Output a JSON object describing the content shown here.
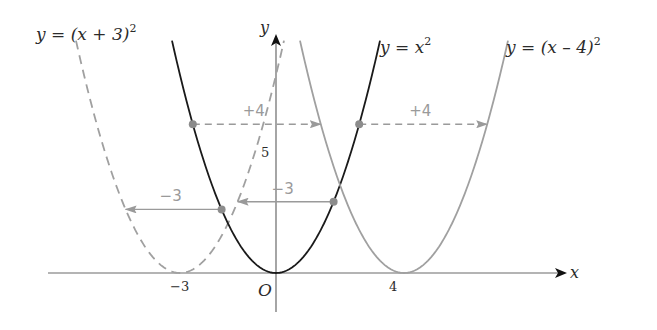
{
  "chart_data": {
    "type": "line",
    "title": "",
    "xlabel": "x",
    "ylabel": "y",
    "origin_label": "O",
    "x_ticks": [
      {
        "value": -3,
        "label": "−3"
      },
      {
        "value": 4,
        "label": "4"
      }
    ],
    "y_ticks": [
      {
        "value": 5,
        "label": "5"
      }
    ],
    "grid": false,
    "xlim": [
      -7,
      9
    ],
    "ylim": [
      0,
      10.5
    ],
    "series": [
      {
        "name": "y = (x + 3)^2",
        "label_main": "y = (x + 3)",
        "label_sup": "2",
        "h": -3,
        "style": "dashed",
        "color": "#a0a0a0"
      },
      {
        "name": "y = x^2",
        "label_main": "y = x",
        "label_sup": "2",
        "h": 0,
        "style": "solid",
        "color": "#1a1a1a"
      },
      {
        "name": "y = (x − 4)^2",
        "label_main": "y = (x – 4)",
        "label_sup": "2",
        "h": 4,
        "style": "solid",
        "color": "#a0a0a0"
      }
    ],
    "annotations": [
      {
        "label": "+4",
        "from_x": -2.6,
        "shift": 4,
        "line": "dashed"
      },
      {
        "label": "+4",
        "from_x": 2.6,
        "shift": 4,
        "line": "dashed"
      },
      {
        "label": "−3",
        "from_x": 1.8,
        "shift": -3,
        "line": "solid"
      },
      {
        "label": "−3",
        "from_x": -1.7,
        "shift": -3,
        "line": "solid"
      }
    ]
  },
  "colors": {
    "axis": "#4a4a4a",
    "arrowhead": "#111111",
    "shift": "#9a9a9a",
    "dot": "#8c8c8c"
  }
}
